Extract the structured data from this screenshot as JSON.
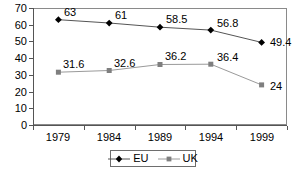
{
  "chart_data": {
    "type": "line",
    "title": "",
    "subtitle": "",
    "xlabel": "",
    "ylabel": "",
    "categories": [
      "1979",
      "1984",
      "1989",
      "1994",
      "1999"
    ],
    "series": [
      {
        "name": "EU",
        "marker": "diamond",
        "color": "#000000",
        "line_color": "#555555",
        "values": [
          63,
          61,
          58.5,
          56.8,
          49.4
        ],
        "labels": [
          "63",
          "61",
          "58.5",
          "56.8",
          "49.4"
        ]
      },
      {
        "name": "UK",
        "marker": "square",
        "color": "#7f7f7f",
        "line_color": "#9a9a9a",
        "values": [
          31.6,
          32.6,
          36.2,
          36.4,
          24
        ],
        "labels": [
          "31.6",
          "32.6",
          "36.2",
          "36.4",
          "24"
        ]
      }
    ],
    "ylim": [
      0,
      70
    ],
    "y_ticks": [
      "70",
      "60",
      "50",
      "40",
      "30",
      "20",
      "10",
      "0"
    ],
    "y_tick_values": [
      70,
      60,
      50,
      40,
      30,
      20,
      10,
      0
    ],
    "grid": false,
    "legend_position": "bottom-center",
    "legend_entries": [
      "EU",
      "UK"
    ],
    "frame_border": true
  }
}
